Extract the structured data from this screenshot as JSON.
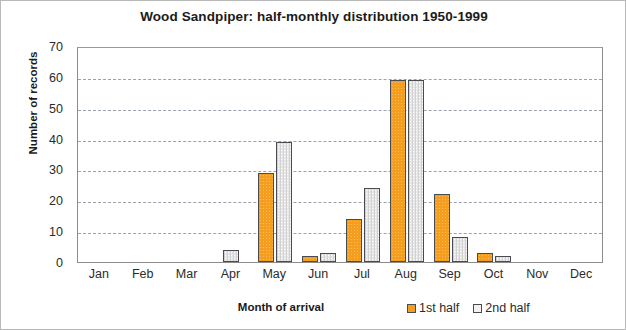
{
  "chart_data": {
    "type": "bar",
    "title": "Wood Sandpiper: half-monthly distribution 1950-1999",
    "xlabel": "Month of arrival",
    "ylabel": "Number of records",
    "categories": [
      "Jan",
      "Feb",
      "Mar",
      "Apr",
      "May",
      "Jun",
      "Jul",
      "Aug",
      "Sep",
      "Oct",
      "Nov",
      "Dec"
    ],
    "series": [
      {
        "name": "1st half",
        "color": "#f59d1d",
        "values": [
          0,
          0,
          0,
          0,
          29,
          2,
          14,
          59,
          22,
          3,
          0,
          0
        ]
      },
      {
        "name": "2nd half",
        "color": "#e6e6e6",
        "values": [
          0,
          0,
          0,
          4,
          39,
          3,
          24,
          59,
          8,
          2,
          0,
          0
        ]
      }
    ],
    "ylim": [
      0,
      70
    ],
    "yticks": [
      0,
      10,
      20,
      30,
      40,
      50,
      60,
      70
    ],
    "ytick_labels": [
      "0",
      "10",
      "20",
      "30",
      "40",
      "50",
      "60",
      "70"
    ],
    "grid": "horizontal-dashed",
    "legend_position": "bottom-right"
  }
}
